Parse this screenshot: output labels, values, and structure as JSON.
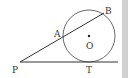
{
  "diagram": {
    "type": "geometry",
    "labels": {
      "P": "P",
      "A": "A",
      "B": "B",
      "O": "O",
      "T": "T"
    },
    "colors": {
      "stroke": "#333333",
      "background": "#ffffff",
      "edge": "#d0d0d0"
    }
  }
}
